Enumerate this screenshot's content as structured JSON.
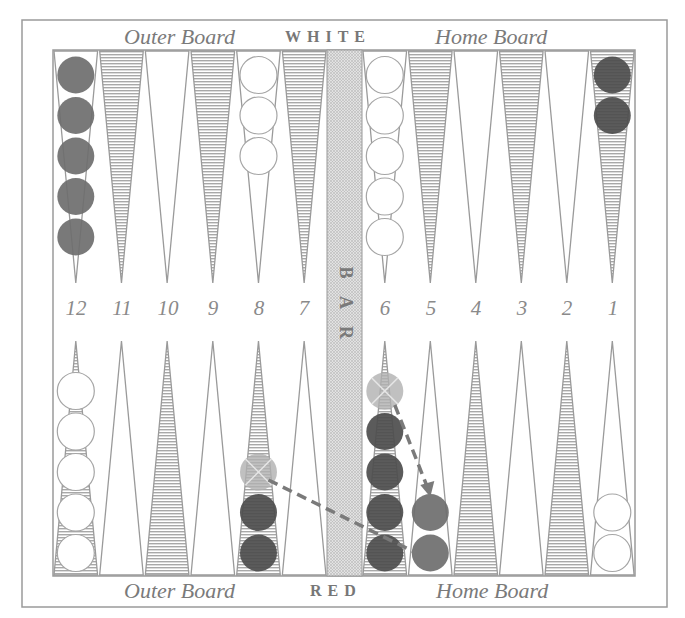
{
  "labels": {
    "top_left": "Outer Board",
    "top_side": "WHITE",
    "top_right": "Home Board",
    "bottom_left": "Outer Board",
    "bottom_side": "RED",
    "bottom_right": "Home Board",
    "bar": [
      "B",
      "A",
      "R"
    ]
  },
  "point_numbers": [
    "12",
    "11",
    "10",
    "9",
    "8",
    "7",
    "6",
    "5",
    "4",
    "3",
    "2",
    "1"
  ],
  "colors": {
    "frame": "#9a9a9a",
    "hatch": "#a8a8a8",
    "red_checker": "#6e6e6e",
    "red_dark_checker": "#4d4d4d",
    "ghost_checker": "#b0b0b0",
    "white_checker": "#ffffff",
    "arrow": "#7a7a7a"
  },
  "position": {
    "top": [
      {
        "point": "12",
        "color": "red",
        "count": 5
      },
      {
        "point": "8",
        "color": "white",
        "count": 3
      },
      {
        "point": "6",
        "color": "white",
        "count": 5
      },
      {
        "point": "1",
        "color": "red_dark",
        "count": 2
      }
    ],
    "bottom": [
      {
        "col": 0,
        "color": "white",
        "count": 5
      },
      {
        "col": 4,
        "color": "red_dark",
        "count": 2,
        "ghost_above": true
      },
      {
        "col": 6,
        "color": "red_dark",
        "count": 4,
        "ghost_above": true
      },
      {
        "col": 7,
        "color": "red",
        "count": 2
      },
      {
        "col": 11,
        "color": "white",
        "count": 2
      }
    ]
  },
  "moves": [
    {
      "from": "bottom col 4 ghost",
      "to": "bottom col 7 lower"
    },
    {
      "from": "bottom col 6 ghost",
      "to": "bottom col 7 upper"
    }
  ]
}
